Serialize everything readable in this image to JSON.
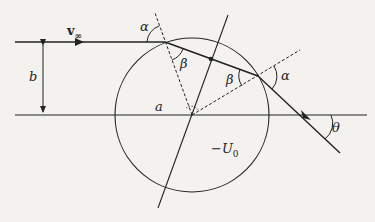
{
  "figure": {
    "labels": {
      "velocity": "v",
      "velocity_sub": "∞",
      "impact_parameter": "b",
      "radius": "a",
      "potential": "−U",
      "potential_sub": "0",
      "alpha_in": "α",
      "alpha_out": "α",
      "beta_in": "β",
      "beta_out": "β",
      "theta": "θ"
    },
    "colors": {
      "ink": "#222222",
      "background": "#f3f2ef"
    }
  }
}
